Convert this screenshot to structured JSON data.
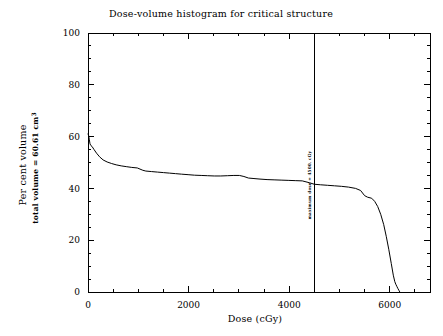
{
  "chart_data": {
    "type": "line",
    "title": "Dose-volume histogram for critical structure",
    "xlabel": "Dose (cGy)",
    "ylabel_line1": "Per cent volume",
    "ylabel_line2": "total volume =  60.61 cm",
    "ylabel_line2_sup": "3",
    "xlim": [
      0,
      6800
    ],
    "ylim": [
      0,
      100
    ],
    "xticks": [
      0,
      2000,
      4000,
      6000
    ],
    "xtick_labels": [
      "0",
      "2000",
      "4000",
      "6000"
    ],
    "yticks": [
      0,
      20,
      40,
      60,
      80,
      100
    ],
    "ytick_labels": [
      "0",
      "20",
      "40",
      "60",
      "80",
      "100"
    ],
    "x_minor_interval": 500,
    "y_minor_interval": 5,
    "grid": false,
    "legend": false,
    "annotations": [
      {
        "name": "maximum-dose-marker",
        "text": "maximum dose =  4500. cGy",
        "x": 4500,
        "orientation": "vertical",
        "line_from_y": 0,
        "line_to_y": 100
      }
    ],
    "series": [
      {
        "name": "critical structure DVH",
        "color": "#000000",
        "points": [
          [
            0,
            61.0
          ],
          [
            10,
            60.6
          ],
          [
            25,
            59.0
          ],
          [
            40,
            57.2
          ],
          [
            55,
            56.6
          ],
          [
            80,
            56.2
          ],
          [
            120,
            55.0
          ],
          [
            170,
            53.6
          ],
          [
            230,
            52.2
          ],
          [
            300,
            51.0
          ],
          [
            380,
            50.2
          ],
          [
            470,
            49.6
          ],
          [
            560,
            49.1
          ],
          [
            660,
            48.7
          ],
          [
            760,
            48.4
          ],
          [
            870,
            48.1
          ],
          [
            980,
            47.9
          ],
          [
            1090,
            47.0
          ],
          [
            1150,
            46.7
          ],
          [
            1260,
            46.5
          ],
          [
            1380,
            46.3
          ],
          [
            1500,
            46.1
          ],
          [
            1620,
            45.9
          ],
          [
            1740,
            45.7
          ],
          [
            1860,
            45.5
          ],
          [
            1990,
            45.3
          ],
          [
            2120,
            45.1
          ],
          [
            2250,
            45.0
          ],
          [
            2380,
            44.9
          ],
          [
            2510,
            44.8
          ],
          [
            2640,
            44.8
          ],
          [
            2770,
            44.9
          ],
          [
            2900,
            45.0
          ],
          [
            3010,
            45.0
          ],
          [
            3100,
            44.6
          ],
          [
            3190,
            44.0
          ],
          [
            3300,
            43.8
          ],
          [
            3420,
            43.6
          ],
          [
            3560,
            43.4
          ],
          [
            3700,
            43.3
          ],
          [
            3840,
            43.2
          ],
          [
            3980,
            43.1
          ],
          [
            4120,
            43.0
          ],
          [
            4260,
            42.9
          ],
          [
            4400,
            42.2
          ],
          [
            4500,
            41.6
          ],
          [
            4620,
            41.4
          ],
          [
            4760,
            41.2
          ],
          [
            4900,
            41.0
          ],
          [
            5040,
            40.8
          ],
          [
            5180,
            40.5
          ],
          [
            5320,
            40.0
          ],
          [
            5420,
            39.2
          ],
          [
            5500,
            37.2
          ],
          [
            5560,
            36.6
          ],
          [
            5640,
            36.2
          ],
          [
            5700,
            35.0
          ],
          [
            5760,
            33.0
          ],
          [
            5820,
            30.0
          ],
          [
            5880,
            26.0
          ],
          [
            5930,
            21.5
          ],
          [
            5980,
            16.5
          ],
          [
            6030,
            11.0
          ],
          [
            6070,
            6.5
          ],
          [
            6100,
            4.0
          ],
          [
            6120,
            3.0
          ],
          [
            6140,
            2.2
          ],
          [
            6160,
            1.4
          ],
          [
            6180,
            0.7
          ],
          [
            6200,
            0.0
          ]
        ]
      }
    ]
  }
}
